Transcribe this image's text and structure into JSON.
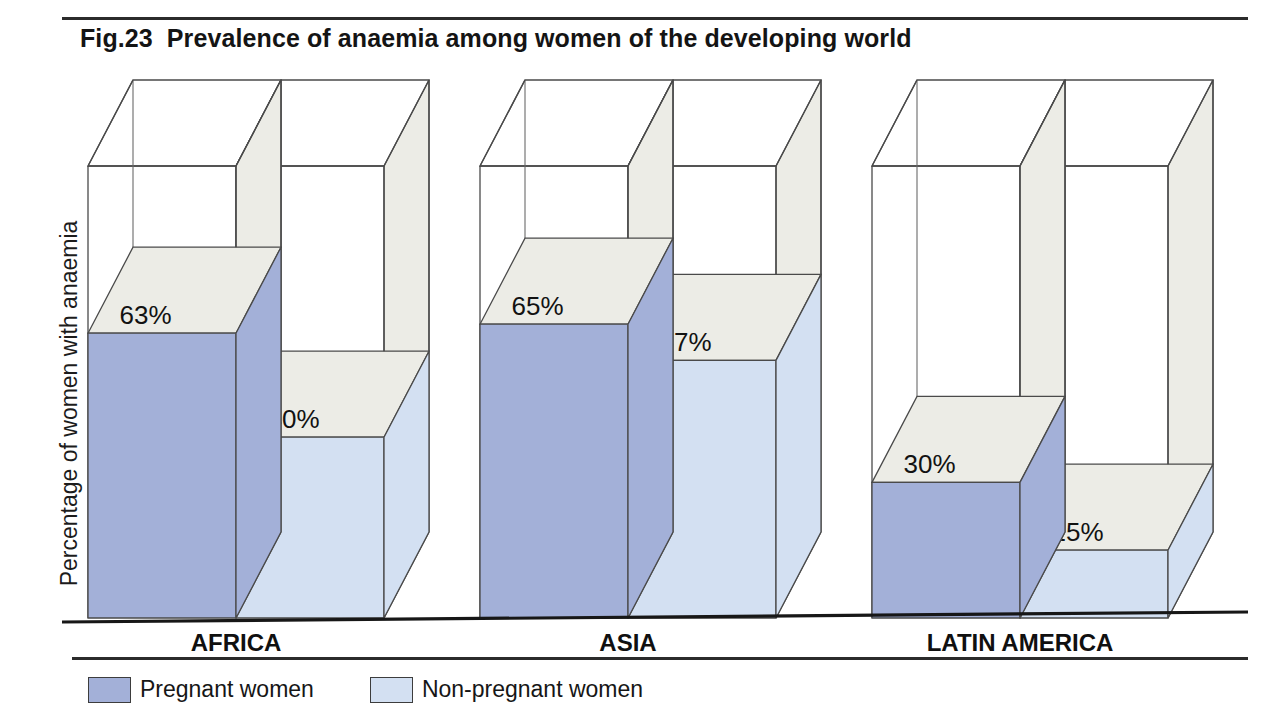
{
  "title": {
    "figure_number": "Fig.23",
    "text": "Prevalence of anaemia among women of the developing world"
  },
  "axis": {
    "y_label": "Percentage of women with anaemia"
  },
  "legend": {
    "items": [
      {
        "label": "Pregnant women",
        "color": "#a3b0d8",
        "key": "pregnant"
      },
      {
        "label": "Non-pregnant women",
        "color": "#d3e0f2",
        "key": "non_pregnant"
      }
    ]
  },
  "colors": {
    "pregnant_fill": "#a3b0d8",
    "non_pregnant_fill": "#d3e0f2",
    "top_face": "#ecece6",
    "side_face": "#ecece6",
    "edge": "#4a4a4a",
    "baseline": "#171717",
    "background": "#ffffff"
  },
  "chart_data": {
    "type": "bar",
    "style": "3d-grouped-column",
    "xlabel": "",
    "ylabel": "Percentage of women with anaemia",
    "ylim": [
      0,
      100
    ],
    "grid": false,
    "legend_position": "bottom-left",
    "unit": "%",
    "categories": [
      "AFRICA",
      "ASIA",
      "LATIN AMERICA"
    ],
    "series": [
      {
        "name": "Pregnant women",
        "color": "#a3b0d8",
        "values": [
          63,
          65,
          30
        ]
      },
      {
        "name": "Non-pregnant women",
        "color": "#d3e0f2",
        "values": [
          40,
          57,
          15
        ]
      }
    ],
    "data_labels": [
      [
        "63%",
        "40%"
      ],
      [
        "65%",
        "57%"
      ],
      [
        "30%",
        "15%"
      ]
    ]
  },
  "geometry": {
    "baseline_y": 618,
    "top_y": 166,
    "depth_dx": 45,
    "depth_dy": -86,
    "bar_width": 148,
    "group_x": [
      88,
      480,
      872
    ]
  }
}
